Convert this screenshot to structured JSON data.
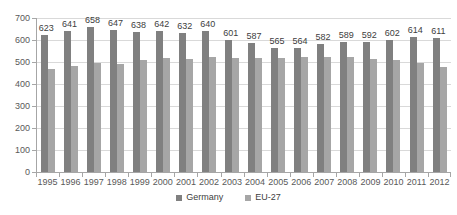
{
  "chart_data": {
    "type": "bar",
    "title": "",
    "xlabel": "",
    "ylabel": "",
    "ylim": [
      0,
      700
    ],
    "ytick_step": 100,
    "yticks": [
      700,
      600,
      500,
      400,
      300,
      200,
      100,
      0
    ],
    "grid": true,
    "legend_position": "bottom",
    "categories": [
      "1995",
      "1996",
      "1997",
      "1998",
      "1999",
      "2000",
      "2001",
      "2002",
      "2003",
      "2004",
      "2005",
      "2006",
      "2007",
      "2008",
      "2009",
      "2010",
      "2011",
      "2012"
    ],
    "series": [
      {
        "name": "Germany",
        "color": "#808080",
        "labels_shown": true,
        "values": [
          623,
          641,
          658,
          647,
          638,
          642,
          632,
          640,
          601,
          587,
          565,
          564,
          582,
          589,
          592,
          602,
          614,
          611
        ]
      },
      {
        "name": "EU-27",
        "color": "#a6a6a6",
        "labels_shown": false,
        "values": [
          470,
          481,
          496,
          492,
          508,
          517,
          515,
          522,
          519,
          518,
          520,
          521,
          525,
          522,
          512,
          508,
          496,
          479
        ]
      }
    ]
  },
  "legend": {
    "items": [
      {
        "label": "Germany",
        "color": "#808080"
      },
      {
        "label": "EU-27",
        "color": "#a6a6a6"
      }
    ]
  }
}
